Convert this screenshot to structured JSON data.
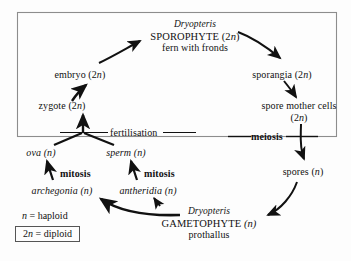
{
  "diagram": {
    "background_color": "#fdfdfd",
    "ink_color": "#111111",
    "box_border_color": "#888888",
    "nodes": {
      "sporophyte": {
        "genus": "Dryopteris",
        "generation": "SPOROPHYTE (2n)",
        "description": "fern with fronds"
      },
      "embryo": "embryo (2n)",
      "zygote": "zygote (2n)",
      "sporangia": "sporangia (2n)",
      "spore_mother_cells_line1": "spore mother cells",
      "spore_mother_cells_line2": "(2n)",
      "spores": "spores (n)",
      "ova": "ova (n)",
      "sperm": "sperm (n)",
      "archegonia": "archegonia (n)",
      "antheridia": "antheridia (n)",
      "gametophyte": {
        "genus": "Dryopteris",
        "generation": "GAMETOPHYTE (n)",
        "description": "prothallus"
      }
    },
    "process_labels": {
      "fertilisation": "fertilisation",
      "meiosis": "meiosis",
      "mitosis_left": "mitosis",
      "mitosis_right": "mitosis"
    },
    "legend": {
      "haploid": "n = haploid",
      "diploid": "2n = diploid"
    }
  }
}
